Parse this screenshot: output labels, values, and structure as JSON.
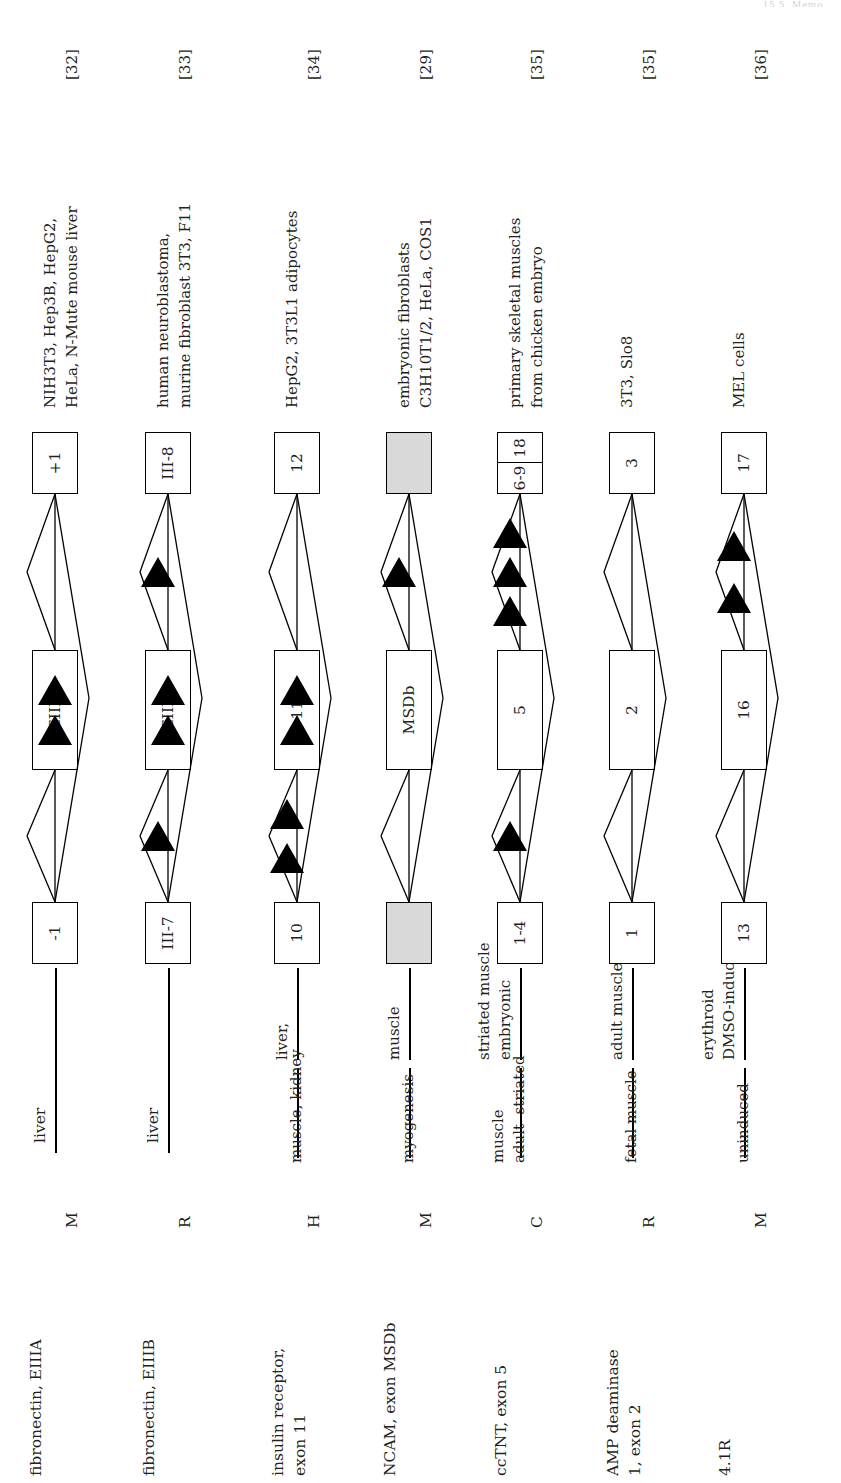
{
  "figure": {
    "running_head": "15.5  Memo",
    "orientation": "rotated-90-ccw",
    "colors": {
      "ink": "#231f20",
      "shaded_exon": "#d9d9d9",
      "cassette_triangle": "#000000",
      "line": "#000000"
    }
  },
  "columns": {
    "gene": "gene, element",
    "species": "species",
    "tissue": "tissue / condition",
    "diagram": "splicing pattern",
    "cells": "cells / tissues used",
    "reference": "reference"
  },
  "rows": [
    {
      "gene": "fibronectin, EIIIA",
      "species": "M",
      "tissues": [
        "liver"
      ],
      "cells": "NIH3T3, Hep3B, HepG2,\nHeLa, N-Mute mouse liver",
      "reference": "[32]",
      "diagram": {
        "upstream_exon": {
          "label": "-1",
          "shaded": false,
          "split": false
        },
        "cassette_exon": {
          "label": "EIIIA",
          "shaded": false,
          "triangles_inside": 2
        },
        "downstream_exon": {
          "label": "+1",
          "shaded": false,
          "split": false
        },
        "triangles_upstream_intron": 0,
        "triangles_downstream_intron": 0
      }
    },
    {
      "gene": "fibronectin, EIIIB",
      "species": "R",
      "tissues": [
        "liver"
      ],
      "cells": "human neuroblastoma,\nmurine fibroblast 3T3, F11",
      "reference": "[33]",
      "diagram": {
        "upstream_exon": {
          "label": "III-7",
          "shaded": false,
          "split": false
        },
        "cassette_exon": {
          "label": "EIIIB",
          "shaded": false,
          "triangles_inside": 2
        },
        "downstream_exon": {
          "label": "III-8",
          "shaded": false,
          "split": false
        },
        "triangles_upstream_intron": 1,
        "triangles_downstream_intron": 1
      }
    },
    {
      "gene": "insulin receptor,\nexon 11",
      "species": "H",
      "tissues": [
        "liver,",
        "muscle, kidney"
      ],
      "cells": "HepG2, 3T3L1 adipocytes",
      "reference": "[34]",
      "diagram": {
        "upstream_exon": {
          "label": "10",
          "shaded": false,
          "split": false
        },
        "cassette_exon": {
          "label": "11",
          "shaded": false,
          "triangles_inside": 2
        },
        "downstream_exon": {
          "label": "12",
          "shaded": false,
          "split": false
        },
        "triangles_upstream_intron": 2,
        "triangles_downstream_intron": 0
      }
    },
    {
      "gene": "NCAM, exon MSDb",
      "species": "M",
      "tissues": [
        "muscle",
        "myogenesis"
      ],
      "cells": "embryonic fibroblasts\nC3H10T1/2, HeLa, COS1",
      "reference": "[29]",
      "diagram": {
        "upstream_exon": {
          "label": "",
          "shaded": true,
          "split": false
        },
        "cassette_exon": {
          "label": "MSDb",
          "shaded": false,
          "triangles_inside": 0
        },
        "downstream_exon": {
          "label": "",
          "shaded": true,
          "split": false
        },
        "triangles_upstream_intron": 0,
        "triangles_downstream_intron": 1
      }
    },
    {
      "gene": "ccTNT, exon 5",
      "species": "C",
      "tissues": [
        "embryonic\nstriated muscle",
        "adult  striated\nmuscle"
      ],
      "cells": "primary skeletal muscles\nfrom chicken embryo",
      "reference": "[35]",
      "diagram": {
        "upstream_exon": {
          "label": "1-4",
          "shaded": false,
          "split": false
        },
        "cassette_exon": {
          "label": "5",
          "shaded": false,
          "triangles_inside": 0
        },
        "downstream_exon": {
          "label_top": "18",
          "label_bottom": "6-9",
          "shaded": false,
          "split": true
        },
        "triangles_upstream_intron": 1,
        "triangles_downstream_intron": 3
      }
    },
    {
      "gene": "AMP deaminase\n1, exon 2",
      "species": "R",
      "tissues": [
        "adult muscle",
        "fetal muscle"
      ],
      "cells": "3T3, Slo8",
      "reference": "[35]",
      "diagram": {
        "upstream_exon": {
          "label": "1",
          "shaded": false,
          "split": false
        },
        "cassette_exon": {
          "label": "2",
          "shaded": false,
          "triangles_inside": 0
        },
        "downstream_exon": {
          "label": "3",
          "shaded": false,
          "split": false
        },
        "triangles_upstream_intron": 0,
        "triangles_downstream_intron": 0
      }
    },
    {
      "gene": "4.1R",
      "species": "M",
      "tissues": [
        "DMSO-induced\nerythroid",
        "uninduced"
      ],
      "cells": "MEL cells",
      "reference": "[36]",
      "diagram": {
        "upstream_exon": {
          "label": "13",
          "shaded": false,
          "split": false
        },
        "cassette_exon": {
          "label": "16",
          "shaded": false,
          "triangles_inside": 0
        },
        "downstream_exon": {
          "label": "17",
          "shaded": false,
          "split": false
        },
        "triangles_upstream_intron": 0,
        "triangles_downstream_intron": 2
      }
    }
  ]
}
